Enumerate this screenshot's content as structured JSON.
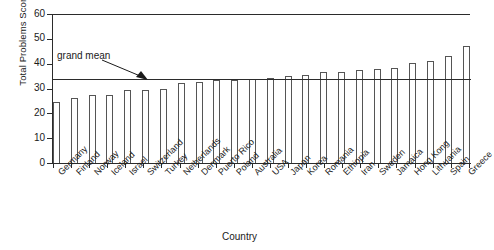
{
  "chart_data": {
    "type": "bar",
    "title": "",
    "xlabel": "Country",
    "ylabel": "Total Problems Score",
    "ylim": [
      0,
      60
    ],
    "yticks": [
      0,
      10,
      20,
      30,
      40,
      50,
      60
    ],
    "grid": false,
    "legend": null,
    "categories": [
      "Germany",
      "Finland",
      "Norway",
      "Iceland",
      "Israel",
      "Switzerland",
      "Turkey",
      "Netherlands",
      "Denmark",
      "Puerto Rico",
      "Poland",
      "Australia",
      "USA",
      "Japan",
      "Korea",
      "Romania",
      "Ethiopia",
      "Iran",
      "Sweden",
      "Jamaica",
      "Hong Kong",
      "Lithuania",
      "Spain",
      "Greece"
    ],
    "values": [
      24.6,
      26.3,
      27.2,
      27.5,
      29.3,
      29.6,
      29.7,
      32.2,
      32.8,
      33.4,
      33.5,
      33.9,
      34.2,
      35.2,
      35.3,
      36.5,
      36.7,
      37.6,
      38.0,
      38.2,
      40.2,
      41.2,
      43.0,
      47.0
    ],
    "annotations": [
      {
        "name": "grand mean",
        "label": "grand mean",
        "value": 33.8,
        "type": "hline-with-arrow"
      }
    ]
  },
  "axis": {
    "y_title": "Total Problems Score",
    "x_title": "Country",
    "tick_labels": [
      "0",
      "10",
      "20",
      "30",
      "40",
      "50",
      "60"
    ]
  },
  "annotation": {
    "grand_mean_label": "grand mean"
  },
  "colors": {
    "bar_fill": "#ffffff",
    "bar_stroke": "#555555",
    "axis": "#2b2b2b",
    "text": "#1a1a1a",
    "background": "#ffffff"
  }
}
